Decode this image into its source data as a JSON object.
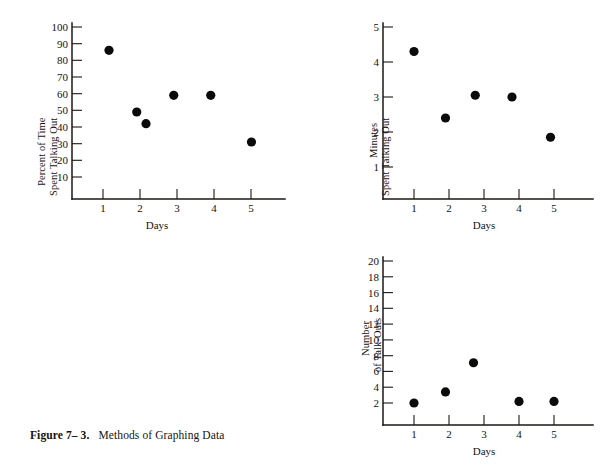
{
  "figure": {
    "number_label": "Figure 7– 3.",
    "caption_text": "Methods of Graphing Data"
  },
  "panels": [
    {
      "id": "panel-percent-time",
      "ylabel_line1": "Percent of Time",
      "ylabel_line2": "Spent Talking Out",
      "xlabel": "Days",
      "ytick_labels": [
        "100",
        "90",
        "80",
        "70",
        "60",
        "50",
        "40",
        "30",
        "20",
        "10"
      ],
      "xtick_labels": [
        "1",
        "2",
        "3",
        "4",
        "5"
      ]
    },
    {
      "id": "panel-minutes-talking",
      "ylabel_line1": "Minutes",
      "ylabel_line2": "Spent Talking Out",
      "xlabel": "Days",
      "ytick_labels": [
        "5",
        "4",
        "3",
        "2",
        "1"
      ],
      "xtick_labels": [
        "1",
        "2",
        "3",
        "4",
        "5"
      ]
    },
    {
      "id": "panel-number-talkouts",
      "ylabel_line1": "Number",
      "ylabel_line2": "of Talk-Outs",
      "xlabel": "Days",
      "ytick_labels": [
        "20",
        "18",
        "16",
        "14",
        "12",
        "10",
        "8",
        "6",
        "4",
        "2"
      ],
      "xtick_labels": [
        "1",
        "2",
        "3",
        "4",
        "5"
      ]
    }
  ],
  "chart_data": [
    {
      "type": "scatter",
      "title": "Percent of Time Spent Talking Out",
      "xlabel": "Days",
      "ylabel": "Percent of Time Spent Talking Out",
      "xlim": [
        0,
        5.9
      ],
      "ylim": [
        0,
        100
      ],
      "yticks": [
        10,
        20,
        30,
        40,
        50,
        60,
        70,
        80,
        90,
        100
      ],
      "xticks": [
        1,
        2,
        3,
        4,
        5
      ],
      "grid": false,
      "legend": "none",
      "marker": "filled-circle",
      "marker_color": "#0d0b09",
      "x": [
        1.0,
        1.75,
        2.0,
        2.75,
        3.75,
        4.85
      ],
      "y": [
        86,
        49,
        42,
        59,
        59,
        31
      ]
    },
    {
      "type": "scatter",
      "title": "Minutes Spent Talking Out",
      "xlabel": "Days",
      "ylabel": "Minutes Spent Talking Out",
      "xlim": [
        0,
        5.9
      ],
      "ylim": [
        0,
        5
      ],
      "yticks": [
        1,
        2,
        3,
        4,
        5
      ],
      "xticks": [
        1,
        2,
        3,
        4,
        5
      ],
      "grid": false,
      "legend": "none",
      "marker": "filled-circle",
      "marker_color": "#0d0b09",
      "x": [
        1.0,
        1.9,
        2.75,
        3.8,
        4.9
      ],
      "y": [
        4.3,
        2.4,
        3.05,
        3.0,
        1.85
      ]
    },
    {
      "type": "scatter",
      "title": "Number of Talk-Outs",
      "xlabel": "Days",
      "ylabel": "Number of Talk-Outs",
      "xlim": [
        0,
        5.9
      ],
      "ylim": [
        0,
        20
      ],
      "yticks": [
        2,
        4,
        6,
        8,
        10,
        12,
        14,
        16,
        18,
        20
      ],
      "xticks": [
        1,
        2,
        3,
        4,
        5
      ],
      "grid": false,
      "legend": "none",
      "marker": "filled-circle",
      "marker_color": "#0d0b09",
      "x": [
        1.0,
        1.9,
        2.7,
        4.0,
        5.0
      ],
      "y": [
        2.0,
        3.4,
        7.1,
        2.2,
        2.2
      ]
    }
  ]
}
